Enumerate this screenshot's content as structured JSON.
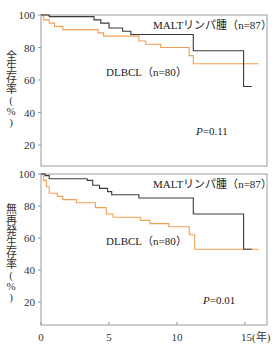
{
  "chart_data": [
    {
      "type": "line",
      "subtype": "kaplan-meier-step",
      "title": "",
      "ylabel": "全生存率（%）",
      "xlabel": "(年)",
      "xlim": [
        0,
        16
      ],
      "ylim": [
        10,
        100
      ],
      "yticks": [
        20,
        40,
        60,
        80,
        100
      ],
      "xticks": [],
      "grid": false,
      "annotation": "P=0.11",
      "series": [
        {
          "name": "MALTリンパ腫（n=87）",
          "color": "#3a3a3a",
          "points": [
            [
              0,
              100
            ],
            [
              0.6,
              100
            ],
            [
              0.6,
              99
            ],
            [
              3.9,
              99
            ],
            [
              3.9,
              97
            ],
            [
              4.4,
              97
            ],
            [
              4.4,
              95
            ],
            [
              5.0,
              95
            ],
            [
              5.0,
              92
            ],
            [
              6.0,
              92
            ],
            [
              6.0,
              90
            ],
            [
              6.6,
              90
            ],
            [
              6.6,
              88
            ],
            [
              11.2,
              88
            ],
            [
              11.2,
              78
            ],
            [
              14.9,
              78
            ],
            [
              14.9,
              56
            ],
            [
              15.5,
              56
            ]
          ]
        },
        {
          "name": "DLBCL（n=80）",
          "color": "#f0a050",
          "points": [
            [
              0,
              100
            ],
            [
              0.2,
              100
            ],
            [
              0.2,
              97
            ],
            [
              0.6,
              97
            ],
            [
              0.6,
              95
            ],
            [
              1.0,
              95
            ],
            [
              1.0,
              93
            ],
            [
              1.6,
              93
            ],
            [
              1.6,
              91
            ],
            [
              4.2,
              91
            ],
            [
              4.2,
              89
            ],
            [
              4.6,
              89
            ],
            [
              4.6,
              87
            ],
            [
              7.2,
              87
            ],
            [
              7.2,
              84
            ],
            [
              7.7,
              84
            ],
            [
              7.7,
              82
            ],
            [
              8.8,
              82
            ],
            [
              8.8,
              80
            ],
            [
              10.9,
              80
            ],
            [
              10.9,
              75
            ],
            [
              11.2,
              75
            ],
            [
              11.2,
              70
            ],
            [
              16,
              70
            ]
          ]
        }
      ]
    },
    {
      "type": "line",
      "subtype": "kaplan-meier-step",
      "title": "",
      "ylabel": "無再発生存率（%）",
      "xlabel": "(年)",
      "xlim": [
        0,
        16
      ],
      "ylim": [
        5,
        100
      ],
      "yticks": [
        20,
        40,
        60,
        80,
        100
      ],
      "xticks": [
        0,
        5,
        10,
        15
      ],
      "grid": false,
      "annotation": "P=0.01",
      "series": [
        {
          "name": "MALTリンパ腫（n=87）",
          "color": "#3a3a3a",
          "points": [
            [
              0,
              100
            ],
            [
              0.3,
              100
            ],
            [
              0.3,
              99
            ],
            [
              0.6,
              99
            ],
            [
              0.6,
              97
            ],
            [
              3.4,
              97
            ],
            [
              3.4,
              96
            ],
            [
              3.8,
              96
            ],
            [
              3.8,
              93
            ],
            [
              4.3,
              93
            ],
            [
              4.3,
              91
            ],
            [
              4.9,
              91
            ],
            [
              4.9,
              89
            ],
            [
              5.2,
              89
            ],
            [
              5.2,
              87
            ],
            [
              7.2,
              87
            ],
            [
              7.2,
              85
            ],
            [
              11.2,
              85
            ],
            [
              11.2,
              75
            ],
            [
              14.9,
              75
            ],
            [
              14.9,
              53
            ],
            [
              15.5,
              53
            ]
          ]
        },
        {
          "name": "DLBCL（n=80）",
          "color": "#f0a050",
          "points": [
            [
              0,
              100
            ],
            [
              0.2,
              100
            ],
            [
              0.2,
              96
            ],
            [
              0.4,
              96
            ],
            [
              0.4,
              92
            ],
            [
              0.6,
              92
            ],
            [
              0.6,
              88
            ],
            [
              1.2,
              88
            ],
            [
              1.2,
              86
            ],
            [
              1.6,
              86
            ],
            [
              1.6,
              84
            ],
            [
              2.6,
              84
            ],
            [
              2.6,
              82
            ],
            [
              4.0,
              82
            ],
            [
              4.0,
              79
            ],
            [
              4.8,
              79
            ],
            [
              4.8,
              75
            ],
            [
              5.3,
              75
            ],
            [
              5.3,
              73
            ],
            [
              7.3,
              73
            ],
            [
              7.3,
              71
            ],
            [
              8.0,
              71
            ],
            [
              8.0,
              69
            ],
            [
              9.4,
              69
            ],
            [
              9.4,
              67
            ],
            [
              10.9,
              67
            ],
            [
              10.9,
              62
            ],
            [
              11.3,
              62
            ],
            [
              11.3,
              53
            ],
            [
              16,
              53
            ]
          ]
        }
      ]
    }
  ],
  "panels": {
    "top": {
      "ylabel": "全生存率（%）",
      "ylabel_chars": [
        "全",
        "生",
        "存",
        "率",
        "(",
        "%",
        ")"
      ],
      "malt_label": "MALTリンパ腫（n=87）",
      "dlbcl_label": "DLBCL（n=80）",
      "p_italic": "P",
      "p_value": "=0.11",
      "yticks": [
        "100",
        "80",
        "60",
        "40",
        "20"
      ]
    },
    "bottom": {
      "ylabel": "無再発生存率（%）",
      "ylabel_chars": [
        "無",
        "再",
        "発",
        "生",
        "存",
        "率",
        "(",
        "%",
        ")"
      ],
      "malt_label": "MALTリンパ腫（n=87）",
      "dlbcl_label": "DLBCL（n=80）",
      "p_italic": "P",
      "p_value": "=0.01",
      "yticks": [
        "100",
        "80",
        "60",
        "40",
        "20"
      ],
      "xticks": [
        "0",
        "5",
        "10",
        "15"
      ],
      "xunit": "(年)"
    }
  },
  "colors": {
    "malt": "#3a3a3a",
    "dlbcl": "#f0a050",
    "frame": "#9a9a9a"
  }
}
